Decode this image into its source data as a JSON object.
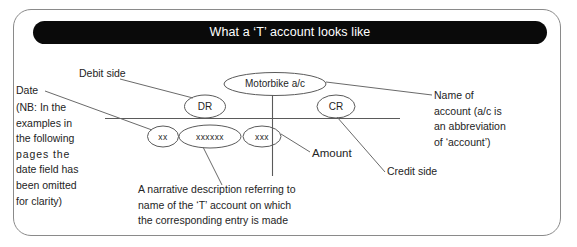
{
  "banner": {
    "title": "What a ‘T’ account looks like"
  },
  "diagram": {
    "account_label": "Motorbike a/c",
    "debit_abbrev": "DR",
    "credit_abbrev": "CR",
    "entry_date": "xx",
    "entry_narrative": "xxxxxx",
    "entry_amount": "xxx"
  },
  "callouts": {
    "debit_side": "Debit side",
    "credit_side": "Credit side",
    "amount": "Amount",
    "date_title": "Date",
    "date_note_lines": [
      "(NB: In the",
      "examples in",
      "the following",
      "pages the",
      "date field has",
      "been omitted",
      "for clarity)"
    ],
    "name_of_account_lines": [
      "Name of",
      "account (a/c is",
      "an abbreviation",
      "of ‘account’)"
    ],
    "narrative_lines": [
      "A narrative description referring to",
      "name of the ‘T’ account on which",
      "the corresponding entry is made"
    ]
  },
  "colors": {
    "banner_bg": "#0a0a0a",
    "banner_text": "#ffffff",
    "frame_border": "#8a8a8a",
    "line": "#5a5a5a",
    "text": "#242424"
  }
}
